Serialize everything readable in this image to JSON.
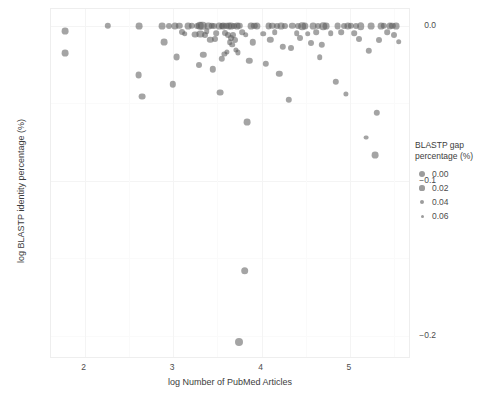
{
  "chart_data": {
    "type": "scatter",
    "title": "",
    "xlabel": "log Number of PubMed Articles",
    "ylabel": "log BLASTP identity percentage (%)",
    "xlim": [
      1.62,
      5.69
    ],
    "ylim": [
      -0.215,
      0.011
    ],
    "xticks": [
      2,
      3,
      4,
      5
    ],
    "xtick_labels": [
      "2",
      "3",
      "4",
      "5"
    ],
    "yticks": [
      0.0,
      -0.1,
      -0.2
    ],
    "ytick_labels": [
      "0.0",
      "-0.1",
      "-0.2"
    ],
    "grid": true,
    "legend": {
      "title": "BLASTP gap percentage (%)",
      "title_line1": "BLASTP gap",
      "title_line2": "percentage (%)",
      "position": "right",
      "size_scale": true,
      "entries": [
        {
          "label": "0.00",
          "value": 0.0,
          "px": 5.2
        },
        {
          "label": "0.02",
          "value": 0.02,
          "px": 4.2
        },
        {
          "label": "0.04",
          "value": 0.04,
          "px": 3.2
        },
        {
          "label": "0.06",
          "value": 0.06,
          "px": 2.4
        }
      ]
    },
    "marker": {
      "color": "#5a5a5a",
      "opacity": 0.55,
      "shape": "circle"
    },
    "point_count": 118,
    "points": [
      {
        "x": 1.78,
        "y": -0.0035,
        "s": 3.4
      },
      {
        "x": 1.78,
        "y": -0.0175,
        "s": 3.4
      },
      {
        "x": 2.26,
        "y": 0.0,
        "s": 3.2
      },
      {
        "x": 2.62,
        "y": 0.0,
        "s": 3.4
      },
      {
        "x": 2.61,
        "y": -0.0315,
        "s": 3.4
      },
      {
        "x": 2.65,
        "y": -0.0455,
        "s": 3.4
      },
      {
        "x": 2.88,
        "y": 0.0,
        "s": 3.4
      },
      {
        "x": 2.9,
        "y": -0.0105,
        "s": 3.4
      },
      {
        "x": 3.02,
        "y": 0.0,
        "s": 3.6
      },
      {
        "x": 3.07,
        "y": 0.0,
        "s": 3.2
      },
      {
        "x": 3.04,
        "y": -0.02,
        "s": 3.4
      },
      {
        "x": 3.0,
        "y": -0.0375,
        "s": 3.2
      },
      {
        "x": 3.17,
        "y": 0.0,
        "s": 3.4
      },
      {
        "x": 3.21,
        "y": 0.0,
        "s": 3.2
      },
      {
        "x": 3.25,
        "y": -0.0055,
        "s": 3.4
      },
      {
        "x": 3.3,
        "y": 0.0,
        "s": 4.2
      },
      {
        "x": 3.33,
        "y": 0.0,
        "s": 4.2
      },
      {
        "x": 3.31,
        "y": -0.005,
        "s": 3.6
      },
      {
        "x": 3.36,
        "y": -0.006,
        "s": 3.0
      },
      {
        "x": 3.34,
        "y": -0.0185,
        "s": 3.2
      },
      {
        "x": 3.29,
        "y": -0.025,
        "s": 3.0
      },
      {
        "x": 3.4,
        "y": 0.0,
        "s": 3.6
      },
      {
        "x": 3.44,
        "y": 0.0,
        "s": 3.2
      },
      {
        "x": 3.42,
        "y": -0.009,
        "s": 3.2
      },
      {
        "x": 3.47,
        "y": -0.0085,
        "s": 3.0
      },
      {
        "x": 3.45,
        "y": -0.028,
        "s": 3.2
      },
      {
        "x": 3.52,
        "y": 0.0,
        "s": 3.4
      },
      {
        "x": 3.55,
        "y": 0.0,
        "s": 3.0
      },
      {
        "x": 3.57,
        "y": 0.0,
        "s": 3.4
      },
      {
        "x": 3.6,
        "y": 0.0,
        "s": 3.2
      },
      {
        "x": 3.63,
        "y": 0.0,
        "s": 3.6
      },
      {
        "x": 3.66,
        "y": 0.0,
        "s": 3.4
      },
      {
        "x": 3.69,
        "y": 0.0,
        "s": 3.0
      },
      {
        "x": 3.72,
        "y": 0.0,
        "s": 3.4
      },
      {
        "x": 3.75,
        "y": 0.0,
        "s": 3.2
      },
      {
        "x": 3.59,
        "y": -0.0045,
        "s": 3.0
      },
      {
        "x": 3.62,
        "y": -0.006,
        "s": 3.0
      },
      {
        "x": 3.65,
        "y": -0.0075,
        "s": 3.0
      },
      {
        "x": 3.68,
        "y": -0.006,
        "s": 3.0
      },
      {
        "x": 3.7,
        "y": -0.009,
        "s": 3.0
      },
      {
        "x": 3.64,
        "y": -0.0105,
        "s": 2.8
      },
      {
        "x": 3.67,
        "y": -0.012,
        "s": 2.8
      },
      {
        "x": 3.55,
        "y": -0.021,
        "s": 3.2
      },
      {
        "x": 3.53,
        "y": -0.043,
        "s": 3.4
      },
      {
        "x": 3.88,
        "y": 0.0,
        "s": 3.4
      },
      {
        "x": 3.92,
        "y": 0.0,
        "s": 3.2
      },
      {
        "x": 3.95,
        "y": 0.0,
        "s": 3.6
      },
      {
        "x": 3.9,
        "y": -0.0105,
        "s": 3.2
      },
      {
        "x": 3.86,
        "y": -0.0225,
        "s": 3.2
      },
      {
        "x": 3.84,
        "y": -0.062,
        "s": 3.4
      },
      {
        "x": 3.81,
        "y": -0.158,
        "s": 3.8
      },
      {
        "x": 3.75,
        "y": -0.204,
        "s": 4.0
      },
      {
        "x": 4.08,
        "y": 0.0,
        "s": 3.4
      },
      {
        "x": 4.12,
        "y": 0.0,
        "s": 3.2
      },
      {
        "x": 4.1,
        "y": -0.009,
        "s": 3.2
      },
      {
        "x": 4.05,
        "y": -0.0245,
        "s": 3.2
      },
      {
        "x": 4.22,
        "y": 0.0,
        "s": 3.4
      },
      {
        "x": 4.26,
        "y": 0.0,
        "s": 3.0
      },
      {
        "x": 4.24,
        "y": -0.0135,
        "s": 3.2
      },
      {
        "x": 4.2,
        "y": -0.031,
        "s": 3.2
      },
      {
        "x": 4.35,
        "y": 0.0,
        "s": 3.2
      },
      {
        "x": 4.33,
        "y": -0.014,
        "s": 3.0
      },
      {
        "x": 4.31,
        "y": -0.0475,
        "s": 3.2
      },
      {
        "x": 4.46,
        "y": 0.0,
        "s": 3.8
      },
      {
        "x": 4.49,
        "y": 0.0,
        "s": 3.6
      },
      {
        "x": 4.44,
        "y": -0.0075,
        "s": 3.0
      },
      {
        "x": 4.58,
        "y": 0.0,
        "s": 3.4
      },
      {
        "x": 4.56,
        "y": -0.011,
        "s": 3.0
      },
      {
        "x": 4.7,
        "y": 0.0,
        "s": 3.8
      },
      {
        "x": 4.73,
        "y": 0.0,
        "s": 3.4
      },
      {
        "x": 4.68,
        "y": -0.012,
        "s": 3.2
      },
      {
        "x": 4.66,
        "y": -0.02,
        "s": 2.8
      },
      {
        "x": 4.86,
        "y": 0.0,
        "s": 3.4
      },
      {
        "x": 4.84,
        "y": -0.036,
        "s": 3.2
      },
      {
        "x": 4.98,
        "y": 0.0,
        "s": 3.6
      },
      {
        "x": 5.01,
        "y": 0.0,
        "s": 3.2
      },
      {
        "x": 5.12,
        "y": 0.0,
        "s": 3.8
      },
      {
        "x": 5.1,
        "y": -0.0085,
        "s": 3.0
      },
      {
        "x": 5.24,
        "y": 0.0,
        "s": 3.4
      },
      {
        "x": 5.21,
        "y": -0.016,
        "s": 3.2
      },
      {
        "x": 5.35,
        "y": 0.0,
        "s": 3.4
      },
      {
        "x": 5.38,
        "y": 0.0,
        "s": 3.2
      },
      {
        "x": 5.33,
        "y": -0.009,
        "s": 3.0
      },
      {
        "x": 5.3,
        "y": -0.056,
        "s": 3.2
      },
      {
        "x": 5.28,
        "y": -0.0835,
        "s": 3.4
      },
      {
        "x": 5.45,
        "y": 0.0,
        "s": 3.6
      },
      {
        "x": 5.48,
        "y": 0.0,
        "s": 3.2
      },
      {
        "x": 5.52,
        "y": 0.0,
        "s": 3.4
      },
      {
        "x": 5.5,
        "y": -0.006,
        "s": 3.0
      },
      {
        "x": 5.55,
        "y": -0.01,
        "s": 2.8
      },
      {
        "x": 5.18,
        "y": -0.072,
        "s": 2.4
      },
      {
        "x": 4.95,
        "y": -0.044,
        "s": 2.6
      },
      {
        "x": 3.1,
        "y": -0.004,
        "s": 3.0
      },
      {
        "x": 3.13,
        "y": -0.005,
        "s": 2.8
      },
      {
        "x": 3.38,
        "y": -0.0035,
        "s": 2.8
      },
      {
        "x": 3.49,
        "y": -0.0045,
        "s": 2.8
      },
      {
        "x": 3.78,
        "y": -0.004,
        "s": 2.8
      },
      {
        "x": 3.82,
        "y": -0.0055,
        "s": 2.8
      },
      {
        "x": 4.02,
        "y": -0.005,
        "s": 2.8
      },
      {
        "x": 4.15,
        "y": -0.004,
        "s": 2.8
      },
      {
        "x": 4.4,
        "y": -0.0045,
        "s": 2.8
      },
      {
        "x": 4.52,
        "y": -0.005,
        "s": 2.8
      },
      {
        "x": 4.62,
        "y": -0.004,
        "s": 2.8
      },
      {
        "x": 4.78,
        "y": -0.0045,
        "s": 2.8
      },
      {
        "x": 4.9,
        "y": -0.004,
        "s": 2.8
      },
      {
        "x": 5.05,
        "y": -0.0045,
        "s": 2.8
      },
      {
        "x": 5.42,
        "y": -0.004,
        "s": 2.8
      },
      {
        "x": 3.71,
        "y": -0.0155,
        "s": 2.6
      },
      {
        "x": 3.73,
        "y": -0.017,
        "s": 2.6
      },
      {
        "x": 3.61,
        "y": -0.0165,
        "s": 2.6
      },
      {
        "x": 3.58,
        "y": -0.018,
        "s": 2.6
      },
      {
        "x": 2.95,
        "y": 0.0,
        "s": 3.0
      },
      {
        "x": 4.41,
        "y": 0.0,
        "s": 3.0
      },
      {
        "x": 4.64,
        "y": 0.0,
        "s": 3.0
      },
      {
        "x": 5.07,
        "y": 0.0,
        "s": 3.0
      },
      {
        "x": 3.46,
        "y": 0.0,
        "s": 3.0
      },
      {
        "x": 3.27,
        "y": 0.0,
        "s": 3.0
      },
      {
        "x": 4.17,
        "y": 0.0,
        "s": 3.0
      },
      {
        "x": 4.93,
        "y": 0.0,
        "s": 3.0
      }
    ]
  }
}
